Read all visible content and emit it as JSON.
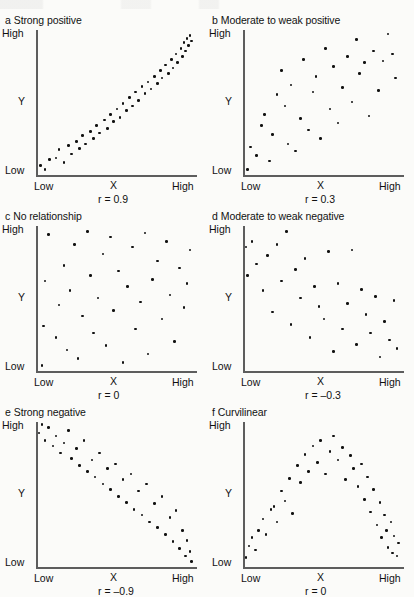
{
  "figure": {
    "type": "scatterplot-matrix"
  },
  "axis_labels": {
    "y_high": "High",
    "y_low": "Low",
    "y_name": "Y",
    "x_low": "Low",
    "x_high": "High",
    "x_name": "X"
  },
  "chart_data": [
    {
      "type": "scatter",
      "panel_letter": "a",
      "title": "Strong positive",
      "annotation": "r = 0.9",
      "r": 0.9,
      "xlabel": "X",
      "ylabel": "Y",
      "xlim": [
        0,
        1
      ],
      "ylim": [
        0,
        1
      ],
      "xticklabels": [
        "Low",
        "High"
      ],
      "yticklabels": [
        "Low",
        "High"
      ],
      "grid": false,
      "legend": false,
      "points": [
        [
          0.02,
          0.05
        ],
        [
          0.05,
          0.02
        ],
        [
          0.08,
          0.09
        ],
        [
          0.12,
          0.1
        ],
        [
          0.14,
          0.16
        ],
        [
          0.17,
          0.07
        ],
        [
          0.2,
          0.19
        ],
        [
          0.22,
          0.13
        ],
        [
          0.25,
          0.22
        ],
        [
          0.27,
          0.17
        ],
        [
          0.29,
          0.26
        ],
        [
          0.31,
          0.2
        ],
        [
          0.34,
          0.29
        ],
        [
          0.36,
          0.24
        ],
        [
          0.38,
          0.33
        ],
        [
          0.4,
          0.28
        ],
        [
          0.43,
          0.37
        ],
        [
          0.45,
          0.31
        ],
        [
          0.47,
          0.41
        ],
        [
          0.49,
          0.36
        ],
        [
          0.51,
          0.45
        ],
        [
          0.53,
          0.39
        ],
        [
          0.55,
          0.49
        ],
        [
          0.57,
          0.44
        ],
        [
          0.59,
          0.53
        ],
        [
          0.61,
          0.47
        ],
        [
          0.63,
          0.57
        ],
        [
          0.65,
          0.51
        ],
        [
          0.67,
          0.61
        ],
        [
          0.69,
          0.56
        ],
        [
          0.71,
          0.64
        ],
        [
          0.73,
          0.59
        ],
        [
          0.75,
          0.68
        ],
        [
          0.77,
          0.63
        ],
        [
          0.79,
          0.72
        ],
        [
          0.8,
          0.67
        ],
        [
          0.82,
          0.76
        ],
        [
          0.84,
          0.7
        ],
        [
          0.86,
          0.8
        ],
        [
          0.87,
          0.74
        ],
        [
          0.89,
          0.84
        ],
        [
          0.9,
          0.78
        ],
        [
          0.92,
          0.88
        ],
        [
          0.93,
          0.82
        ],
        [
          0.94,
          0.92
        ],
        [
          0.95,
          0.86
        ],
        [
          0.96,
          0.95
        ],
        [
          0.97,
          0.9
        ],
        [
          0.98,
          0.97
        ],
        [
          0.99,
          0.93
        ]
      ]
    },
    {
      "type": "scatter",
      "panel_letter": "b",
      "title": "Moderate to weak positive",
      "annotation": "r = 0.3",
      "r": 0.3,
      "xlabel": "X",
      "ylabel": "Y",
      "xlim": [
        0,
        1
      ],
      "ylim": [
        0,
        1
      ],
      "xticklabels": [
        "Low",
        "High"
      ],
      "yticklabels": [
        "Low",
        "High"
      ],
      "grid": false,
      "legend": false,
      "points": [
        [
          0.02,
          0.02
        ],
        [
          0.04,
          0.18
        ],
        [
          0.08,
          0.12
        ],
        [
          0.11,
          0.33
        ],
        [
          0.13,
          0.41
        ],
        [
          0.16,
          0.08
        ],
        [
          0.18,
          0.27
        ],
        [
          0.21,
          0.55
        ],
        [
          0.24,
          0.72
        ],
        [
          0.26,
          0.47
        ],
        [
          0.28,
          0.2
        ],
        [
          0.3,
          0.62
        ],
        [
          0.33,
          0.15
        ],
        [
          0.36,
          0.38
        ],
        [
          0.38,
          0.8
        ],
        [
          0.41,
          0.3
        ],
        [
          0.44,
          0.57
        ],
        [
          0.46,
          0.68
        ],
        [
          0.49,
          0.24
        ],
        [
          0.52,
          0.88
        ],
        [
          0.55,
          0.45
        ],
        [
          0.57,
          0.75
        ],
        [
          0.6,
          0.35
        ],
        [
          0.63,
          0.6
        ],
        [
          0.66,
          0.82
        ],
        [
          0.69,
          0.5
        ],
        [
          0.72,
          0.94
        ],
        [
          0.74,
          0.7
        ],
        [
          0.77,
          0.78
        ],
        [
          0.8,
          0.4
        ],
        [
          0.83,
          0.86
        ],
        [
          0.86,
          0.58
        ],
        [
          0.89,
          0.79
        ],
        [
          0.92,
          0.98
        ],
        [
          0.95,
          0.84
        ],
        [
          0.97,
          0.67
        ]
      ]
    },
    {
      "type": "scatter",
      "panel_letter": "c",
      "title": "No relationship",
      "annotation": "r = 0",
      "r": 0,
      "xlabel": "X",
      "ylabel": "Y",
      "xlim": [
        0,
        1
      ],
      "ylim": [
        0,
        1
      ],
      "xticklabels": [
        "Low",
        "High"
      ],
      "yticklabels": [
        "Low",
        "High"
      ],
      "grid": false,
      "legend": false,
      "points": [
        [
          0.03,
          0.02
        ],
        [
          0.04,
          0.3
        ],
        [
          0.05,
          0.62
        ],
        [
          0.07,
          0.95
        ],
        [
          0.12,
          0.22
        ],
        [
          0.14,
          0.45
        ],
        [
          0.17,
          0.73
        ],
        [
          0.19,
          0.13
        ],
        [
          0.21,
          0.55
        ],
        [
          0.24,
          0.88
        ],
        [
          0.26,
          0.07
        ],
        [
          0.29,
          0.37
        ],
        [
          0.32,
          0.97
        ],
        [
          0.34,
          0.66
        ],
        [
          0.36,
          0.25
        ],
        [
          0.39,
          0.5
        ],
        [
          0.42,
          0.81
        ],
        [
          0.44,
          0.16
        ],
        [
          0.47,
          0.93
        ],
        [
          0.49,
          0.41
        ],
        [
          0.52,
          0.69
        ],
        [
          0.55,
          0.04
        ],
        [
          0.58,
          0.58
        ],
        [
          0.61,
          0.86
        ],
        [
          0.63,
          0.28
        ],
        [
          0.66,
          0.47
        ],
        [
          0.69,
          0.96
        ],
        [
          0.71,
          0.1
        ],
        [
          0.74,
          0.63
        ],
        [
          0.77,
          0.76
        ],
        [
          0.8,
          0.35
        ],
        [
          0.83,
          0.9
        ],
        [
          0.85,
          0.52
        ],
        [
          0.88,
          0.19
        ],
        [
          0.91,
          0.71
        ],
        [
          0.94,
          0.43
        ],
        [
          0.96,
          0.6
        ],
        [
          0.98,
          0.84
        ]
      ]
    },
    {
      "type": "scatter",
      "panel_letter": "d",
      "title": "Moderate to weak negative",
      "annotation": "r = –0.3",
      "r": -0.3,
      "xlabel": "X",
      "ylabel": "Y",
      "xlim": [
        0,
        1
      ],
      "ylim": [
        0,
        1
      ],
      "xticklabels": [
        "Low",
        "High"
      ],
      "yticklabels": [
        "Low",
        "High"
      ],
      "grid": false,
      "legend": false,
      "points": [
        [
          0.01,
          0.86
        ],
        [
          0.02,
          0.66
        ],
        [
          0.05,
          0.9
        ],
        [
          0.08,
          0.74
        ],
        [
          0.12,
          0.55
        ],
        [
          0.15,
          0.8
        ],
        [
          0.18,
          0.4
        ],
        [
          0.21,
          0.88
        ],
        [
          0.24,
          0.62
        ],
        [
          0.27,
          0.97
        ],
        [
          0.3,
          0.31
        ],
        [
          0.33,
          0.7
        ],
        [
          0.36,
          0.5
        ],
        [
          0.39,
          0.78
        ],
        [
          0.42,
          0.22
        ],
        [
          0.45,
          0.58
        ],
        [
          0.48,
          0.44
        ],
        [
          0.51,
          0.35
        ],
        [
          0.54,
          0.83
        ],
        [
          0.57,
          0.12
        ],
        [
          0.6,
          0.6
        ],
        [
          0.63,
          0.28
        ],
        [
          0.66,
          0.46
        ],
        [
          0.69,
          0.84
        ],
        [
          0.72,
          0.17
        ],
        [
          0.75,
          0.56
        ],
        [
          0.78,
          0.38
        ],
        [
          0.81,
          0.25
        ],
        [
          0.84,
          0.51
        ],
        [
          0.87,
          0.08
        ],
        [
          0.9,
          0.33
        ],
        [
          0.93,
          0.2
        ],
        [
          0.96,
          0.48
        ],
        [
          0.98,
          0.14
        ]
      ]
    },
    {
      "type": "scatter",
      "panel_letter": "e",
      "title": "Strong negative",
      "annotation": "r = –0.9",
      "r": -0.9,
      "xlabel": "X",
      "ylabel": "Y",
      "xlim": [
        0,
        1
      ],
      "ylim": [
        0,
        1
      ],
      "xticklabels": [
        "Low",
        "High"
      ],
      "yticklabels": [
        "Low",
        "High"
      ],
      "grid": false,
      "legend": false,
      "points": [
        [
          0.01,
          0.93
        ],
        [
          0.03,
          0.99
        ],
        [
          0.05,
          0.88
        ],
        [
          0.07,
          0.97
        ],
        [
          0.1,
          0.84
        ],
        [
          0.12,
          0.91
        ],
        [
          0.15,
          0.79
        ],
        [
          0.17,
          0.86
        ],
        [
          0.2,
          0.95
        ],
        [
          0.22,
          0.75
        ],
        [
          0.25,
          0.82
        ],
        [
          0.27,
          0.7
        ],
        [
          0.3,
          0.88
        ],
        [
          0.32,
          0.66
        ],
        [
          0.35,
          0.74
        ],
        [
          0.37,
          0.62
        ],
        [
          0.4,
          0.79
        ],
        [
          0.42,
          0.57
        ],
        [
          0.45,
          0.68
        ],
        [
          0.47,
          0.53
        ],
        [
          0.5,
          0.71
        ],
        [
          0.52,
          0.48
        ],
        [
          0.55,
          0.6
        ],
        [
          0.57,
          0.44
        ],
        [
          0.6,
          0.64
        ],
        [
          0.62,
          0.39
        ],
        [
          0.65,
          0.52
        ],
        [
          0.67,
          0.35
        ],
        [
          0.7,
          0.57
        ],
        [
          0.72,
          0.3
        ],
        [
          0.75,
          0.43
        ],
        [
          0.77,
          0.26
        ],
        [
          0.8,
          0.48
        ],
        [
          0.82,
          0.21
        ],
        [
          0.85,
          0.33
        ],
        [
          0.87,
          0.16
        ],
        [
          0.89,
          0.38
        ],
        [
          0.91,
          0.11
        ],
        [
          0.93,
          0.24
        ],
        [
          0.95,
          0.06
        ],
        [
          0.96,
          0.17
        ],
        [
          0.98,
          0.09
        ],
        [
          0.99,
          0.02
        ]
      ]
    },
    {
      "type": "scatter",
      "panel_letter": "f",
      "title": "Curvilinear",
      "annotation": "r = 0",
      "r": 0,
      "xlabel": "X",
      "ylabel": "Y",
      "xlim": [
        0,
        1
      ],
      "ylim": [
        0,
        1
      ],
      "xticklabels": [
        "Low",
        "High"
      ],
      "yticklabels": [
        "Low",
        "High"
      ],
      "grid": false,
      "legend": false,
      "points": [
        [
          0.01,
          0.05
        ],
        [
          0.03,
          0.13
        ],
        [
          0.05,
          0.19
        ],
        [
          0.07,
          0.1
        ],
        [
          0.09,
          0.24
        ],
        [
          0.12,
          0.32
        ],
        [
          0.14,
          0.21
        ],
        [
          0.17,
          0.39
        ],
        [
          0.19,
          0.41
        ],
        [
          0.21,
          0.3
        ],
        [
          0.24,
          0.52
        ],
        [
          0.26,
          0.45
        ],
        [
          0.29,
          0.61
        ],
        [
          0.31,
          0.36
        ],
        [
          0.34,
          0.7
        ],
        [
          0.36,
          0.58
        ],
        [
          0.39,
          0.78
        ],
        [
          0.41,
          0.66
        ],
        [
          0.44,
          0.84
        ],
        [
          0.47,
          0.72
        ],
        [
          0.49,
          0.88
        ],
        [
          0.52,
          0.64
        ],
        [
          0.55,
          0.8
        ],
        [
          0.57,
          0.91
        ],
        [
          0.6,
          0.74
        ],
        [
          0.63,
          0.83
        ],
        [
          0.65,
          0.6
        ],
        [
          0.68,
          0.77
        ],
        [
          0.7,
          0.68
        ],
        [
          0.73,
          0.55
        ],
        [
          0.75,
          0.71
        ],
        [
          0.77,
          0.46
        ],
        [
          0.79,
          0.62
        ],
        [
          0.81,
          0.37
        ],
        [
          0.83,
          0.53
        ],
        [
          0.85,
          0.28
        ],
        [
          0.87,
          0.44
        ],
        [
          0.88,
          0.19
        ],
        [
          0.9,
          0.35
        ],
        [
          0.91,
          0.24
        ],
        [
          0.92,
          0.12
        ],
        [
          0.94,
          0.3
        ],
        [
          0.95,
          0.08
        ],
        [
          0.96,
          0.2
        ],
        [
          0.98,
          0.06
        ],
        [
          0.99,
          0.15
        ]
      ]
    }
  ]
}
